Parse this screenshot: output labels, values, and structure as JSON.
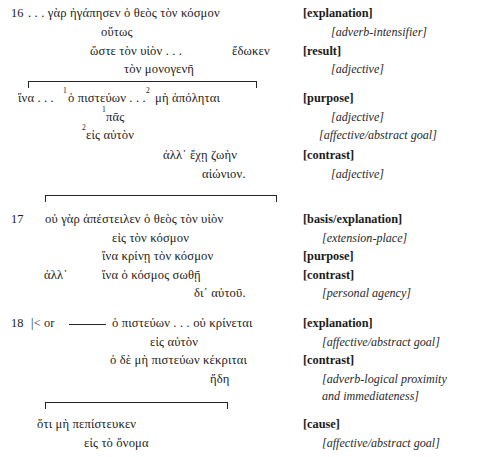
{
  "document": {
    "type": "greek-discourse-diagram",
    "background": "#ffffff",
    "ink": "#1b1b1b"
  },
  "verses": [
    {
      "number": "16",
      "lines": [
        {
          "text": ". . . γὰρ ἠγάπησεν ὁ θεὸς τὸν κόσμον"
        },
        {
          "text": "οὕτως"
        },
        {
          "text": "ὥστε τὸν υἱὸν . . ."
        },
        {
          "text": "ἔδωκεν"
        },
        {
          "text": "τὸν μονογενῆ"
        },
        {
          "text": "ἵνα . . .",
          "sup1": "1",
          "text2": "ὁ πιστεύων . . .",
          "sup2": "2",
          "text3": "μὴ ἀπόληται"
        },
        {
          "text": "πᾶς",
          "sup": "1"
        },
        {
          "text": "εἰς αὐτὸν",
          "sup": "2"
        },
        {
          "text": "ἀλλ᾽ ἔχῃ ζωὴν"
        },
        {
          "text": "αἰώνιον."
        }
      ]
    },
    {
      "number": "17",
      "lines": [
        {
          "text": "οὐ γὰρ ἀπέστειλεν ὁ θεὸς τὸν υἱὸν"
        },
        {
          "text": "εἰς τὸν κόσμον"
        },
        {
          "text": "ἵνα κρίνῃ τὸν κόσμον"
        },
        {
          "text": "ἀλλ᾽"
        },
        {
          "text": "ἵνα ὁ κόσμος σωθῇ"
        },
        {
          "text": "δι᾽ αὐτοῦ."
        }
      ]
    },
    {
      "number": "18",
      "marker": "|< or",
      "lines": [
        {
          "text": "ὁ πιστεύων . . . οὐ κρίνεται"
        },
        {
          "text": "εἰς αὐτὸν"
        },
        {
          "text": "ὁ δὲ μὴ πιστεύων κέκριται"
        },
        {
          "text": "ἤδη"
        },
        {
          "text": "ὅτι μὴ πεπίστευκεν"
        },
        {
          "text": "εἰς τὸ ὄνομα"
        }
      ]
    }
  ],
  "greek": {
    "v16_l1": "16 . . . γὰρ ἠγάπησεν ὁ θεὸς τὸν κόσμον",
    "v16_l1_num": "16",
    "v16_l1_body": ". . . γὰρ ἠγάπησεν ὁ θεὸς τὸν κόσμον",
    "v16_l2": "οὕτως",
    "v16_l3": "ὥστε τὸν υἱὸν . . .",
    "v16_l3b": "ἔδωκεν",
    "v16_l4": "τὸν μονογενῆ",
    "v16_l5a": "ἵνα . . .",
    "v16_l5sup1": "1",
    "v16_l5b": "ὁ πιστεύων . . .",
    "v16_l5sup2": "2",
    "v16_l5c": "μὴ ἀπόληται",
    "v16_l6sup": "1",
    "v16_l6": "πᾶς",
    "v16_l7sup": "2",
    "v16_l7": "εἰς αὐτὸν",
    "v16_l8": "ἀλλ᾽ ἔχῃ ζωὴν",
    "v16_l9": "αἰώνιον.",
    "v17_num": "17",
    "v17_l1": "οὐ γὰρ ἀπέστειλεν ὁ θεὸς τὸν υἱὸν",
    "v17_l2": "εἰς τὸν κόσμον",
    "v17_l3": "ἵνα κρίνῃ τὸν κόσμον",
    "v17_alla": "ἀλλ᾽",
    "v17_l4": "ἵνα ὁ κόσμος σωθῇ",
    "v17_l5": "δι᾽ αὐτοῦ.",
    "v18_num": "18",
    "v18_marker": "|< or",
    "v18_l1": "ὁ πιστεύων . . . οὐ κρίνεται",
    "v18_l2": "εἰς αὐτὸν",
    "v18_l3": "ὁ δὲ μὴ πιστεύων κέκριται",
    "v18_l4": "ἤδη",
    "v18_l5": "ὅτι μὴ πεπίστευκεν",
    "v18_l6": "εἰς τὸ ὄνομα"
  },
  "annotations": [
    {
      "category": "[explanation]",
      "kind": "category"
    },
    {
      "category": "[adverb-intensifier]",
      "kind": "feature"
    },
    {
      "category": "[result]",
      "kind": "category"
    },
    {
      "category": "[adjective]",
      "kind": "feature"
    },
    {
      "category": "[purpose]",
      "kind": "category"
    },
    {
      "category": "[adjective]",
      "kind": "feature"
    },
    {
      "category": "[affective/abstract goal]",
      "kind": "feature"
    },
    {
      "category": "[contrast]",
      "kind": "category"
    },
    {
      "category": "[adjective]",
      "kind": "feature"
    },
    {
      "category": "[basis/explanation]",
      "kind": "category"
    },
    {
      "category": "[extension-place]",
      "kind": "feature"
    },
    {
      "category": "[purpose]",
      "kind": "category"
    },
    {
      "category": "[contrast]",
      "kind": "category"
    },
    {
      "category": "[personal agency]",
      "kind": "feature"
    },
    {
      "category": "[explanation]",
      "kind": "category"
    },
    {
      "category": "[affective/abstract goal]",
      "kind": "feature"
    },
    {
      "category": "[contrast]",
      "kind": "category"
    },
    {
      "category": "[adverb-logical proximity",
      "kind": "feature"
    },
    {
      "category": "and immediateness]",
      "kind": "feature"
    },
    {
      "category": "[cause]",
      "kind": "category"
    },
    {
      "category": "[affective/abstract goal]",
      "kind": "feature"
    }
  ],
  "labels": {
    "a01": "[explanation]",
    "a02": "[adverb-intensifier]",
    "a03": "[result]",
    "a04": "[adjective]",
    "a05": "[purpose]",
    "a06": "[adjective]",
    "a07": "[affective/abstract goal]",
    "a08": "[contrast]",
    "a09": "[adjective]",
    "a10": "[basis/explanation]",
    "a11": "[extension-place]",
    "a12": "[purpose]",
    "a13": "[contrast]",
    "a14": "[personal agency]",
    "a15": "[explanation]",
    "a16": "[affective/abstract goal]",
    "a17": "[contrast]",
    "a18": "[adverb-logical proximity",
    "a19": "and immediateness]",
    "a20": "[cause]",
    "a21": "[affective/abstract goal]"
  }
}
